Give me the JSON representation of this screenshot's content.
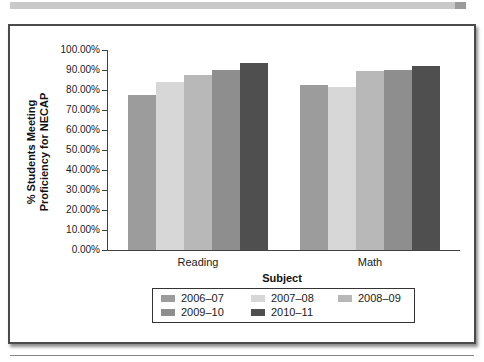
{
  "page": {
    "top_strip_color": "#c9c9c9",
    "top_strip_cap_color": "#9b9b9b",
    "figure_border_color": "#4a4a4a",
    "bottom_rule_color": "#868686"
  },
  "chart_data": {
    "type": "bar",
    "title": "",
    "xlabel": "Subject",
    "ylabel": "% Students Meeting Proficiency for NECAP",
    "ylabel_lines": [
      "% Students Meeting",
      "Proficiency for NECAP"
    ],
    "categories": [
      "Reading",
      "Math"
    ],
    "series": [
      {
        "name": "2006–07",
        "color": "#9c9c9c",
        "values": [
          77.5,
          82.5
        ]
      },
      {
        "name": "2007–08",
        "color": "#d7d7d7",
        "values": [
          84.0,
          81.5
        ]
      },
      {
        "name": "2008–09",
        "color": "#b8b8b8",
        "values": [
          87.5,
          89.3
        ]
      },
      {
        "name": "2009–10",
        "color": "#8e8e8e",
        "values": [
          90.0,
          89.8
        ]
      },
      {
        "name": "2010–11",
        "color": "#4f4f4f",
        "values": [
          93.5,
          92.0
        ]
      }
    ],
    "ylim": [
      0,
      100
    ],
    "ytick_step": 10,
    "yticks": [
      "100.00%",
      "90.00%",
      "80.00%",
      "70.00%",
      "60.00%",
      "50.00%",
      "40.00%",
      "30.00%",
      "20.00%",
      "10.00%",
      "0.00%"
    ],
    "grid": false,
    "legend_position": "bottom",
    "axis_color": "#404040"
  }
}
